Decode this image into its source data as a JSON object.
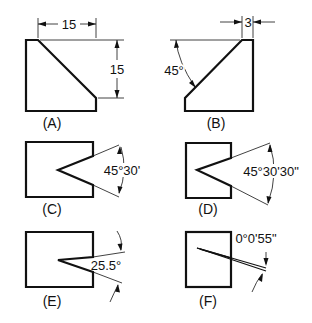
{
  "figure": {
    "panels": [
      {
        "id": "A",
        "label": "(A)",
        "dimensions": [
          "15",
          "15"
        ]
      },
      {
        "id": "B",
        "label": "(B)",
        "dimensions": [
          "3",
          "45°"
        ]
      },
      {
        "id": "C",
        "label": "(C)",
        "dimensions": [
          "45°30'"
        ]
      },
      {
        "id": "D",
        "label": "(D)",
        "dimensions": [
          "45°30'30\""
        ]
      },
      {
        "id": "E",
        "label": "(E)",
        "dimensions": [
          "25.5°"
        ]
      },
      {
        "id": "F",
        "label": "(F)",
        "dimensions": [
          "0°0'55\""
        ]
      }
    ]
  }
}
